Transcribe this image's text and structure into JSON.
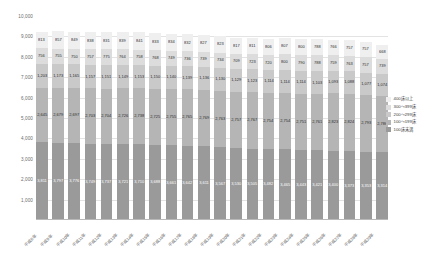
{
  "chart_data": {
    "type": "bar",
    "stacked": true,
    "title": "",
    "xlabel": "",
    "ylabel": "",
    "ylim": [
      0,
      10000
    ],
    "ytick_step": 1000,
    "ytick_labels": [
      "10,000",
      "9,000",
      "8,000",
      "7,000",
      "6,000",
      "5,000",
      "4,000",
      "3,000",
      "2,000",
      "1,000"
    ],
    "grid": true,
    "legend_position": "right",
    "categories": [
      "平成8年",
      "平成9年",
      "平成10年",
      "平成11年",
      "平成12年",
      "平成13年",
      "平成14年",
      "平成15年",
      "平成16年",
      "平成17年",
      "平成18年",
      "平成19年",
      "平成20年",
      "平成21年",
      "平成22年",
      "平成23年",
      "平成24年",
      "平成25年",
      "平成26年",
      "平成27年",
      "平成28年",
      "平成29年"
    ],
    "series": [
      {
        "name": "100床未満",
        "color": "#9a9a9a",
        "values": [
          3811,
          3797,
          3776,
          3749,
          3737,
          3721,
          3710,
          3688,
          3661,
          3642,
          3611,
          3567,
          3530,
          3505,
          3482,
          3465,
          3443,
          3421,
          3400,
          3373,
          3353,
          3314
        ],
        "labels": [
          "3,811",
          "3,797",
          "3,776",
          "3,749",
          "3,737",
          "3,721",
          "3,710",
          "3,688",
          "3,661",
          "3,642",
          "3,611",
          "3,567",
          "3,530",
          "3,505",
          "3,482",
          "3,465",
          "3,443",
          "3,421",
          "3,400",
          "3,373",
          "3,353",
          "3,314"
        ]
      },
      {
        "name": "100～199床",
        "color": "#b5b5b5",
        "values": [
          2645,
          2679,
          2697,
          2703,
          2704,
          2726,
          2738,
          2725,
          2755,
          2765,
          2769,
          2763,
          2757,
          2767,
          2754,
          2754,
          2751,
          2761,
          2823,
          2824,
          2793,
          2786
        ],
        "labels": [
          "2,645",
          "2,679",
          "2,697",
          "2,703",
          "2,704",
          "2,726",
          "2,738",
          "2,725",
          "2,755",
          "2,765",
          "2,769",
          "2,763",
          "2,757",
          "2,767",
          "2,754",
          "2,754",
          "2,751",
          "2,761",
          "2,823",
          "2,824",
          "2,793",
          "2,786"
        ]
      },
      {
        "name": "200～299床",
        "color": "#c9c9c9",
        "values": [
          1203,
          1173,
          1165,
          1157,
          1151,
          1149,
          1153,
          1150,
          1140,
          1139,
          1136,
          1130,
          1129,
          1123,
          1114,
          1114,
          1114,
          1103,
          1093,
          1088,
          1077,
          1074
        ],
        "labels": [
          "1,203",
          "1,173",
          "1,165",
          "1,157",
          "1,151",
          "1,149",
          "1,153",
          "1,150",
          "1,140",
          "1,139",
          "1,136",
          "1,130",
          "1,129",
          "1,123",
          "1,114",
          "1,114",
          "1,114",
          "1,103",
          "1,093",
          "1,088",
          "1,077",
          "1,074"
        ]
      },
      {
        "name": "300～399床",
        "color": "#dcdcdc",
        "values": [
          756,
          755,
          750,
          757,
          775,
          764,
          758,
          768,
          749,
          736,
          739,
          734,
          709,
          723,
          720,
          800,
          790,
          788,
          759,
          763,
          757,
          739
        ],
        "labels": [
          "756",
          "755",
          "750",
          "757",
          "775",
          "764",
          "758",
          "768",
          "749",
          "736",
          "739",
          "734",
          "709",
          "723",
          "720",
          "800",
          "790",
          "788",
          "759",
          "763",
          "757",
          "739"
        ]
      },
      {
        "name": "400床以上",
        "color": "#efefef",
        "values": [
          813,
          857,
          849,
          838,
          831,
          839,
          841,
          833,
          834,
          832,
          827,
          823,
          817,
          811,
          806,
          807,
          800,
          788,
          766,
          757,
          757,
          668
        ],
        "labels": [
          "813",
          "857",
          "849",
          "838",
          "831",
          "839",
          "841",
          "833",
          "834",
          "832",
          "827",
          "823",
          "817",
          "811",
          "806",
          "807",
          "800",
          "788",
          "766",
          "757",
          "757",
          "668"
        ]
      }
    ],
    "legend_entries": [
      {
        "label": "400床以上",
        "color": "#efefef"
      },
      {
        "label": "300～399床",
        "color": "#dcdcdc"
      },
      {
        "label": "200～299床",
        "color": "#c9c9c9"
      },
      {
        "label": "100～199床",
        "color": "#b5b5b5"
      },
      {
        "label": "100床未満",
        "color": "#9a9a9a"
      }
    ]
  }
}
